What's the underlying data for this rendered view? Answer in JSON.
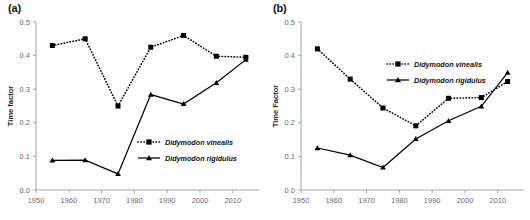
{
  "figure": {
    "panels": [
      {
        "id": "a",
        "label": "(a)",
        "chart_data": {
          "type": "line",
          "title": "",
          "xlabel": "",
          "ylabel": "Time factor",
          "xlim": [
            1950,
            2018
          ],
          "ylim": [
            0.0,
            0.5
          ],
          "xticks": [
            1950,
            1960,
            1970,
            1980,
            1990,
            2000,
            2010
          ],
          "xtick_labels": [
            "1950",
            "1960",
            "1970",
            "1980",
            "1990",
            "2000",
            "2010"
          ],
          "yticks": [
            0.0,
            0.1,
            0.2,
            0.3,
            0.4,
            0.5
          ],
          "ytick_labels": [
            "0.0",
            "0.1",
            "0.2",
            "0.3",
            "0.4",
            "0.5"
          ],
          "grid": false,
          "legend_position": "center-right",
          "x": [
            1955,
            1965,
            1975,
            1985,
            1995,
            2005,
            2014
          ],
          "series": [
            {
              "name": "Didymodon vinealis",
              "marker": "square",
              "line": "dotted",
              "values": [
                0.43,
                0.45,
                0.25,
                0.425,
                0.46,
                0.398,
                0.395
              ]
            },
            {
              "name": "Didymodon rigidulus",
              "marker": "triangle",
              "line": "solid",
              "values": [
                0.088,
                0.089,
                0.048,
                0.284,
                0.256,
                0.319,
                0.388
              ]
            }
          ]
        }
      },
      {
        "id": "b",
        "label": "(b)",
        "chart_data": {
          "type": "line",
          "title": "",
          "xlabel": "",
          "ylabel": "Time Factor",
          "xlim": [
            1950,
            2018
          ],
          "ylim": [
            0.0,
            0.5
          ],
          "xticks": [
            1950,
            1960,
            1970,
            1980,
            1990,
            2000,
            2010
          ],
          "xtick_labels": [
            "1950",
            "1960",
            "1970",
            "1980",
            "1990",
            "2000",
            "2010"
          ],
          "yticks": [
            0.0,
            0.1,
            0.2,
            0.3,
            0.4,
            0.5
          ],
          "ytick_labels": [
            "0.0",
            "0.1",
            "0.2",
            "0.3",
            "0.4",
            "0.5"
          ],
          "grid": false,
          "legend_position": "upper-right",
          "x": [
            1955,
            1965,
            1975,
            1985,
            1995,
            2005,
            2013
          ],
          "series": [
            {
              "name": "Didymodon vinealis",
              "marker": "square",
              "line": "dotted",
              "values": [
                0.42,
                0.33,
                0.244,
                0.191,
                0.273,
                0.275,
                0.323
              ]
            },
            {
              "name": "Didymodon rigidulus",
              "marker": "triangle",
              "line": "solid",
              "values": [
                0.125,
                0.104,
                0.067,
                0.152,
                0.206,
                0.249,
                0.349
              ]
            }
          ]
        }
      }
    ],
    "colors": {
      "line": "#000000",
      "axis": "#9a9a9a",
      "tick_text": "#6a6a6a",
      "title_text": "#111111",
      "background": "#ffffff"
    }
  }
}
